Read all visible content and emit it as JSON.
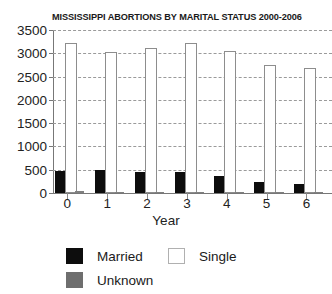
{
  "chart_data": {
    "type": "bar",
    "title": "MISSISSIPPI ABORTIONS BY MARITAL STATUS 2000-2006",
    "xlabel": "Year",
    "ylabel": "",
    "categories": [
      "0",
      "1",
      "2",
      "3",
      "4",
      "5",
      "6"
    ],
    "series": [
      {
        "name": "Married",
        "color": "#0d0d0d",
        "values": [
          470,
          490,
          450,
          450,
          370,
          230,
          200
        ]
      },
      {
        "name": "Single",
        "color": "#ffffff",
        "values": [
          3230,
          3030,
          3110,
          3230,
          3060,
          2740,
          2680
        ]
      },
      {
        "name": "Unknown",
        "color": "#6e6e6e",
        "values": [
          40,
          10,
          15,
          20,
          5,
          5,
          5
        ]
      }
    ],
    "ylim": [
      0,
      3500
    ],
    "ytick_labels": [
      "0",
      "500",
      "1000",
      "1500",
      "2000",
      "2500",
      "3000",
      "3500"
    ],
    "ytick_values": [
      0,
      500,
      1000,
      1500,
      2000,
      2500,
      3000,
      3500
    ],
    "grid": true,
    "grid_style": "dashed-horizontal",
    "legend_position": "below-left"
  },
  "legend": {
    "married_label": "Married",
    "single_label": "Single",
    "unknown_label": "Unknown"
  }
}
